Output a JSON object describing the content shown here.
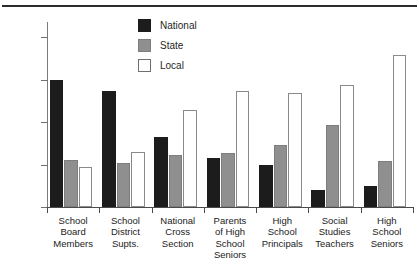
{
  "chart_data": {
    "type": "bar",
    "title": "",
    "subtitle": "",
    "xlabel": "",
    "ylabel": "",
    "ylim": [
      0,
      87
    ],
    "yticks": [
      0,
      20,
      40,
      60,
      80
    ],
    "ytick_labels": [
      "0%",
      "20%",
      "40%",
      "60%",
      "80%"
    ],
    "grid": false,
    "legend_position": "top-center",
    "categories": [
      "School\nBoard\nMembers",
      "School\nDistrict\nSupts.",
      "National\nCross\nSection",
      "Parents\nof High\nSchool\nSeniors",
      "High\nSchool\nPrincipals",
      "Social\nStudies\nTeachers",
      "High\nSchool\nSeniors"
    ],
    "series": [
      {
        "name": "National",
        "color": "#1c1c1c",
        "values": [
          60,
          54.5,
          33,
          23,
          20,
          8,
          10
        ]
      },
      {
        "name": "State",
        "color": "#8f8f8f",
        "values": [
          22,
          20.5,
          24.5,
          25.5,
          29,
          38.5,
          21.5
        ]
      },
      {
        "name": "Local",
        "color": "#ffffff",
        "values": [
          19,
          26,
          45.5,
          54.5,
          53.5,
          57.5,
          71.5
        ]
      }
    ]
  },
  "legend": {
    "items": [
      {
        "label": "National",
        "key": "national"
      },
      {
        "label": "State",
        "key": "state"
      },
      {
        "label": "Local",
        "key": "local"
      }
    ]
  }
}
